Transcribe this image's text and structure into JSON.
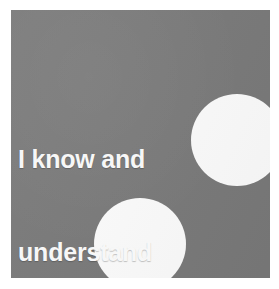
{
  "canvas": {
    "width": 279,
    "height": 289,
    "background_color": "#ffffff"
  },
  "card": {
    "name": "gray-card",
    "fill_color": "#7a7a7a",
    "x": 11,
    "y": 10,
    "width": 259,
    "height": 268
  },
  "caption": {
    "full_text": "I know and understand you",
    "color": "#f7f7f7",
    "lines": [
      {
        "text": "I know and",
        "align": "left"
      },
      {
        "text": "understand",
        "align": "left"
      },
      {
        "text": "you",
        "align": "center"
      }
    ]
  },
  "shapes": [
    {
      "name": "circle-right",
      "type": "circle",
      "fill_color": "#fdfdfd",
      "center_x": 237,
      "center_y": 140,
      "radius": 46,
      "clipped_edge": "right"
    },
    {
      "name": "circle-bottom",
      "type": "circle",
      "fill_color": "#fdfdfd",
      "center_x": 140,
      "center_y": 244,
      "radius": 46,
      "clipped_edge": "bottom"
    }
  ]
}
